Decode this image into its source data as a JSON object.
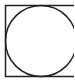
{
  "figure": {
    "shapes": [
      {
        "type": "square",
        "name": "outer-square",
        "stroke": "#222222"
      },
      {
        "type": "circle",
        "name": "inscribed-circle",
        "stroke": "#222222"
      }
    ],
    "background": "#ffffff"
  }
}
